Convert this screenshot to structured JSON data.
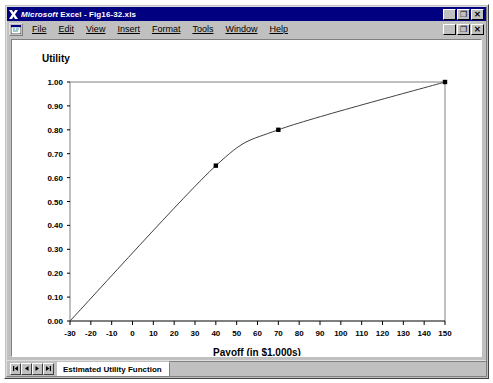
{
  "window": {
    "title_app": "Microsoft",
    "title_rest": " Excel - Fig16-32.xls",
    "title_full": "Microsoft Excel - Fig16-32.xls",
    "app_icon": "excel-x-icon",
    "buttons": {
      "minimize": "_",
      "restore": "❐",
      "close": "✕"
    }
  },
  "menubar": {
    "doc_icon": "workbook-icon",
    "items": [
      {
        "label": "File",
        "accel": "F"
      },
      {
        "label": "Edit",
        "accel": "E"
      },
      {
        "label": "View",
        "accel": "V"
      },
      {
        "label": "Insert",
        "accel": "I"
      },
      {
        "label": "Format",
        "accel": "o"
      },
      {
        "label": "Tools",
        "accel": "T"
      },
      {
        "label": "Window",
        "accel": "W"
      },
      {
        "label": "Help",
        "accel": "H"
      }
    ],
    "doc_buttons": {
      "minimize": "_",
      "restore": "❐",
      "close": "✕"
    }
  },
  "tabbar": {
    "nav_first": "◀▏",
    "nav_prev": "◀",
    "nav_next": "▶",
    "nav_last": "▏▶",
    "sheet_name": "Estimated Utility Function"
  },
  "chart_data": {
    "type": "line",
    "title": "",
    "xlabel": "Payoff (in $1,000s)",
    "ylabel": "Utility",
    "xlim": [
      -30,
      150
    ],
    "ylim": [
      0.0,
      1.0
    ],
    "xticks": [
      -30,
      -20,
      -10,
      0,
      10,
      20,
      30,
      40,
      50,
      60,
      70,
      80,
      90,
      100,
      110,
      120,
      130,
      140,
      150
    ],
    "xtick_labels": [
      "-30",
      "-20",
      "-10",
      "0",
      "10",
      "20",
      "30",
      "40",
      "50",
      "60",
      "70",
      "80",
      "90",
      "100",
      "110",
      "120",
      "130",
      "140",
      "150"
    ],
    "yticks": [
      0.0,
      0.1,
      0.2,
      0.3,
      0.4,
      0.5,
      0.6,
      0.7,
      0.8,
      0.9,
      1.0
    ],
    "ytick_labels": [
      "0.00",
      "0.10",
      "0.20",
      "0.30",
      "0.40",
      "0.50",
      "0.60",
      "0.70",
      "0.80",
      "0.90",
      "1.00"
    ],
    "grid": false,
    "legend": false,
    "marker": "square",
    "marker_color": "#000000",
    "line_color": "#404040",
    "series": [
      {
        "name": "Estimated Utility Function",
        "x": [
          -30,
          40,
          70,
          150
        ],
        "y": [
          0.0,
          0.65,
          0.8,
          1.0
        ]
      }
    ]
  }
}
